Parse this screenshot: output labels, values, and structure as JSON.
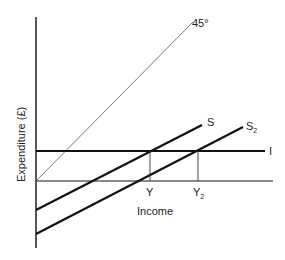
{
  "diagram": {
    "type": "savings-investment-diagram",
    "y_axis_label": "Expenditure (£)",
    "x_axis_label": "Income",
    "line_labels": {
      "forty_five": "45°",
      "savings": "S",
      "savings2_main": "S",
      "savings2_sub": "2",
      "investment": "I"
    },
    "equilibrium_labels": {
      "y": "Y",
      "y2_main": "Y",
      "y2_sub": "2"
    },
    "colors": {
      "line": "#111111",
      "thin_line": "#444444",
      "background": "#ffffff"
    }
  }
}
